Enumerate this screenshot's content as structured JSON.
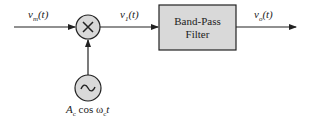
{
  "diagram": {
    "type": "block-diagram",
    "title": "",
    "signals": {
      "input": {
        "name": "v",
        "sub": "m",
        "arg": "(t)"
      },
      "mixer_out": {
        "name": "v",
        "sub": "1",
        "arg": "(t)"
      },
      "output": {
        "name": "v",
        "sub": "o",
        "arg": "(t)"
      }
    },
    "blocks": {
      "mixer": {
        "symbol": "×",
        "label": "multiplier"
      },
      "oscillator": {
        "symbol": "~",
        "label_parts": {
          "A": "A",
          "A_sub": "c",
          "cos": " cos ω",
          "w_sub": "c",
          "t": "t"
        }
      },
      "filter": {
        "line1": "Band-Pass",
        "line2": "Filter"
      }
    },
    "colors": {
      "stroke": "#222222",
      "fill": "#d9d9d9"
    }
  }
}
